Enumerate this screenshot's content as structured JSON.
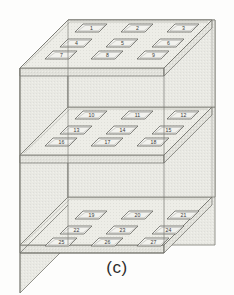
{
  "figure": {
    "caption": "(c)",
    "type": "isometric-cube-diagram",
    "colors": {
      "slab_top_fill": "#e6e6e0",
      "slab_side_fill": "#dedeD7",
      "body_fill": "#e9e9e3",
      "outline": "#6f6f68",
      "tile_fill": "#f2f2ee",
      "tile_outline": "#575752",
      "label_color": "#3a3a38",
      "caption_color": "#2b2b2b",
      "background": "#fdfdfc"
    },
    "layers": [
      {
        "name": "top-layer",
        "tiles": [
          {
            "id": "tile-1",
            "label": "1"
          },
          {
            "id": "tile-2",
            "label": "2"
          },
          {
            "id": "tile-3",
            "label": "3"
          },
          {
            "id": "tile-4",
            "label": "4"
          },
          {
            "id": "tile-5",
            "label": "5"
          },
          {
            "id": "tile-6",
            "label": "6"
          },
          {
            "id": "tile-7",
            "label": "7"
          },
          {
            "id": "tile-8",
            "label": "8"
          },
          {
            "id": "tile-9",
            "label": "9"
          }
        ]
      },
      {
        "name": "middle-layer",
        "tiles": [
          {
            "id": "tile-10",
            "label": "10"
          },
          {
            "id": "tile-11",
            "label": "11"
          },
          {
            "id": "tile-12",
            "label": "12"
          },
          {
            "id": "tile-13",
            "label": "13"
          },
          {
            "id": "tile-14",
            "label": "14"
          },
          {
            "id": "tile-15",
            "label": "15"
          },
          {
            "id": "tile-16",
            "label": "16"
          },
          {
            "id": "tile-17",
            "label": "17"
          },
          {
            "id": "tile-18",
            "label": "18"
          }
        ]
      },
      {
        "name": "bottom-layer",
        "tiles": [
          {
            "id": "tile-19",
            "label": "19"
          },
          {
            "id": "tile-20",
            "label": "20"
          },
          {
            "id": "tile-21",
            "label": "21"
          },
          {
            "id": "tile-22",
            "label": "22"
          },
          {
            "id": "tile-23",
            "label": "23"
          },
          {
            "id": "tile-24",
            "label": "24"
          },
          {
            "id": "tile-25",
            "label": "25"
          },
          {
            "id": "tile-26",
            "label": "26"
          },
          {
            "id": "tile-27",
            "label": "27"
          }
        ]
      }
    ]
  }
}
